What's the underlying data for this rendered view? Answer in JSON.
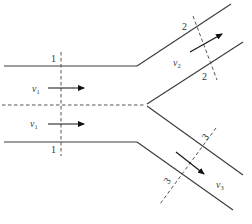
{
  "diagram": {
    "type": "pipe-bifurcation-flow",
    "colors": {
      "wall": "#3a3a3a",
      "dashed": "#555555",
      "arrow": "#111111",
      "background": "#ffffff"
    },
    "sections": [
      {
        "id": "1",
        "label_top": "1",
        "label_bottom": "1"
      },
      {
        "id": "2",
        "label_top": "2",
        "label_bottom": "2"
      },
      {
        "id": "3",
        "label_top": "3",
        "label_bottom": "3"
      }
    ],
    "velocities": [
      {
        "symbol": "v",
        "subscript": "1",
        "location": "inlet upper half"
      },
      {
        "symbol": "v",
        "subscript": "1",
        "location": "inlet lower half"
      },
      {
        "symbol": "v",
        "subscript": "2",
        "location": "upper branch"
      },
      {
        "symbol": "v",
        "subscript": "3",
        "location": "lower branch"
      }
    ],
    "centerline": "dashed axis of inlet pipe"
  }
}
